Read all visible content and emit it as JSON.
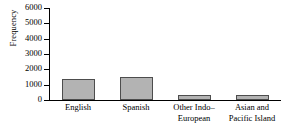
{
  "chart_data": {
    "type": "bar",
    "title": "",
    "xlabel": "",
    "ylabel": "Frequency",
    "categories": [
      "English",
      "Spanish",
      "Other Indo–European",
      "Asian and Pacific Island"
    ],
    "category_lines": [
      [
        "English"
      ],
      [
        "Spanish"
      ],
      [
        "Other Indo–",
        "European"
      ],
      [
        "Asian and",
        "Pacific Island"
      ]
    ],
    "values": [
      1400,
      1500,
      300,
      330
    ],
    "ylim": [
      0,
      6000
    ],
    "yticks": [
      0,
      1000,
      2000,
      3000,
      4000,
      5000,
      6000
    ],
    "ytick_labels": [
      "0",
      "1000",
      "2000",
      "3000",
      "4000",
      "5000",
      "6000"
    ],
    "grid": false,
    "legend": null,
    "bar_color": "#b3b3b3",
    "bar_edge_color": "#4d4d4d",
    "axis_color": "#000000"
  }
}
